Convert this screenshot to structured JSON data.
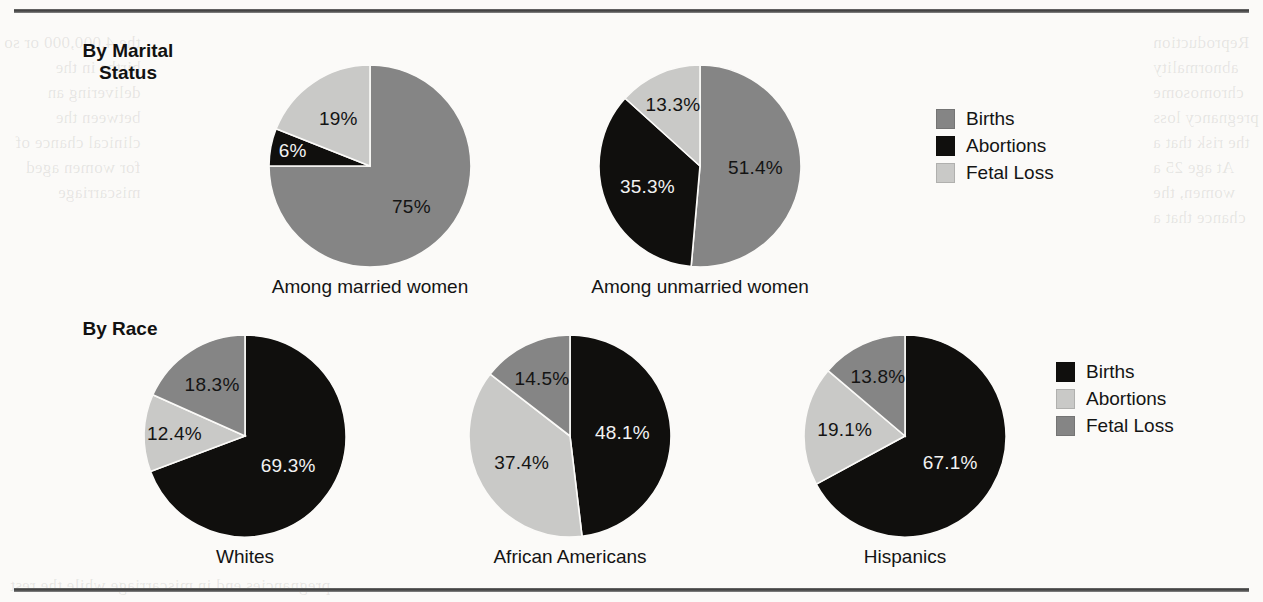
{
  "page": {
    "background_color": "#fbfaf8",
    "rule_color": "#3c3c3c",
    "ghost_text_left": "the 4,000,000 or so\nbirths in the\ndelivering an\nbetween the\nclinical chance of\nfor women aged\nmiscarriage",
    "ghost_text_right": "Reproduction\nabnormality\nchromosome\npregnancy loss\nthe risk that a\nAt age 25 a\nwomen, the\nchance that a",
    "ghost_text_bottom": "pregnancies end in miscarriage while the rest"
  },
  "colors": {
    "births_top": "#858585",
    "abortions_top": "#100f0d",
    "fetal_loss_top": "#c9c9c7",
    "births_bottom": "#100f0d",
    "abortions_bottom": "#c9c9c7",
    "fetal_loss_bottom": "#858585",
    "label_dark": "#141414",
    "label_light": "#f2f2f2"
  },
  "sections": [
    {
      "id": "marital",
      "heading": "By Marital\nStatus",
      "legend": [
        {
          "label": "Births",
          "color": "#858585"
        },
        {
          "label": "Abortions",
          "color": "#100f0d"
        },
        {
          "label": "Fetal Loss",
          "color": "#c9c9c7"
        }
      ]
    },
    {
      "id": "race",
      "heading": "By Race",
      "legend": [
        {
          "label": "Births",
          "color": "#100f0d"
        },
        {
          "label": "Abortions",
          "color": "#c9c9c7"
        },
        {
          "label": "Fetal Loss",
          "color": "#858585"
        }
      ]
    }
  ],
  "chart_data": [
    {
      "type": "pie",
      "title": "Among married women",
      "section": "By Marital Status",
      "start_angle_deg": 0,
      "direction": "clockwise",
      "labels": [
        "Births",
        "Abortions",
        "Fetal Loss"
      ],
      "values": [
        75,
        6,
        19
      ],
      "value_labels": [
        "75%",
        "6%",
        "19%"
      ],
      "colors": [
        "#858585",
        "#100f0d",
        "#c9c9c7"
      ],
      "label_text_colors": [
        "#141414",
        "#f2f2f2",
        "#141414"
      ]
    },
    {
      "type": "pie",
      "title": "Among unmarried women",
      "section": "By Marital Status",
      "start_angle_deg": 0,
      "direction": "clockwise",
      "labels": [
        "Births",
        "Abortions",
        "Fetal Loss"
      ],
      "values": [
        51.4,
        35.3,
        13.3
      ],
      "value_labels": [
        "51.4%",
        "35.3%",
        "13.3%"
      ],
      "colors": [
        "#858585",
        "#100f0d",
        "#c9c9c7"
      ],
      "label_text_colors": [
        "#141414",
        "#f2f2f2",
        "#141414"
      ]
    },
    {
      "type": "pie",
      "title": "Whites",
      "section": "By Race",
      "start_angle_deg": 0,
      "direction": "clockwise",
      "labels": [
        "Births",
        "Abortions",
        "Fetal Loss"
      ],
      "values": [
        69.3,
        12.4,
        18.3
      ],
      "value_labels": [
        "69.3%",
        "12.4%",
        "18.3%"
      ],
      "colors": [
        "#100f0d",
        "#c9c9c7",
        "#858585"
      ],
      "label_text_colors": [
        "#f2f2f2",
        "#141414",
        "#141414"
      ]
    },
    {
      "type": "pie",
      "title": "African Americans",
      "section": "By Race",
      "start_angle_deg": 0,
      "direction": "clockwise",
      "labels": [
        "Births",
        "Abortions",
        "Fetal Loss"
      ],
      "values": [
        48.1,
        37.4,
        14.5
      ],
      "value_labels": [
        "48.1%",
        "37.4%",
        "14.5%"
      ],
      "colors": [
        "#100f0d",
        "#c9c9c7",
        "#858585"
      ],
      "label_text_colors": [
        "#f2f2f2",
        "#141414",
        "#141414"
      ]
    },
    {
      "type": "pie",
      "title": "Hispanics",
      "section": "By Race",
      "start_angle_deg": 0,
      "direction": "clockwise",
      "labels": [
        "Births",
        "Abortions",
        "Fetal Loss"
      ],
      "values": [
        67.1,
        19.1,
        13.8
      ],
      "value_labels": [
        "67.1%",
        "19.1%",
        "13.8%"
      ],
      "colors": [
        "#100f0d",
        "#c9c9c7",
        "#858585"
      ],
      "label_text_colors": [
        "#f2f2f2",
        "#141414",
        "#141414"
      ]
    }
  ],
  "layout": {
    "pies": [
      {
        "cx": 370,
        "cy": 166,
        "r": 101,
        "caption_y": 276,
        "label_r_frac": [
          0.58,
          0.78,
          0.56
        ]
      },
      {
        "cx": 700,
        "cy": 166,
        "r": 101,
        "caption_y": 276,
        "label_r_frac": [
          0.55,
          0.56,
          0.66
        ]
      },
      {
        "cx": 245,
        "cy": 436,
        "r": 101,
        "caption_y": 546,
        "label_r_frac": [
          0.52,
          0.7,
          0.6
        ]
      },
      {
        "cx": 570,
        "cy": 436,
        "r": 101,
        "caption_y": 546,
        "label_r_frac": [
          0.52,
          0.55,
          0.63
        ]
      },
      {
        "cx": 905,
        "cy": 436,
        "r": 101,
        "caption_y": 546,
        "label_r_frac": [
          0.52,
          0.6,
          0.64
        ]
      }
    ]
  }
}
